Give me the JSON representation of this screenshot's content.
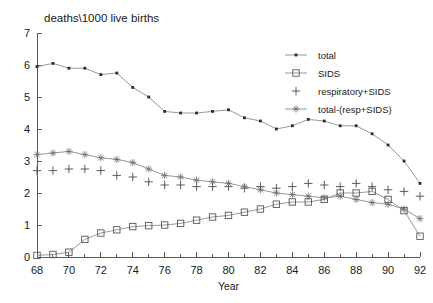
{
  "chart_data": {
    "type": "line",
    "title": "deaths\\1000 live births",
    "xlabel": "Year",
    "ylabel": "",
    "xlim": [
      68,
      92
    ],
    "ylim": [
      0,
      7
    ],
    "xticks": [
      68,
      70,
      72,
      74,
      76,
      78,
      80,
      82,
      84,
      86,
      88,
      90,
      92
    ],
    "yticks": [
      0,
      1,
      2,
      3,
      4,
      5,
      6,
      7
    ],
    "minor_xticks": [
      69,
      71,
      73,
      75,
      77,
      79,
      81,
      83,
      85,
      87,
      89,
      91
    ],
    "grid": false,
    "legend_position": "top-right",
    "x": [
      68,
      69,
      70,
      71,
      72,
      73,
      74,
      75,
      76,
      77,
      78,
      79,
      80,
      81,
      82,
      83,
      84,
      85,
      86,
      87,
      88,
      89,
      90,
      91,
      92
    ],
    "series": [
      {
        "name": "total",
        "marker": "dot",
        "values": [
          5.95,
          6.05,
          5.9,
          5.9,
          5.7,
          5.75,
          5.3,
          5.0,
          4.55,
          4.5,
          4.5,
          4.55,
          4.6,
          4.35,
          4.25,
          4.0,
          4.1,
          4.3,
          4.25,
          4.1,
          4.1,
          3.85,
          3.5,
          3.0,
          2.3
        ]
      },
      {
        "name": "SIDS",
        "marker": "square",
        "values": [
          0.05,
          0.08,
          0.15,
          0.55,
          0.75,
          0.85,
          0.95,
          0.98,
          1.0,
          1.05,
          1.15,
          1.25,
          1.3,
          1.4,
          1.5,
          1.65,
          1.72,
          1.72,
          1.8,
          2.0,
          2.0,
          2.05,
          1.8,
          1.45,
          0.65
        ]
      },
      {
        "name": "respiratory+SIDS",
        "marker": "plus",
        "values": [
          2.7,
          2.7,
          2.75,
          2.75,
          2.7,
          2.55,
          2.5,
          2.35,
          2.25,
          2.25,
          2.2,
          2.2,
          2.2,
          2.15,
          2.2,
          2.15,
          2.2,
          2.3,
          2.25,
          2.2,
          2.3,
          2.2,
          2.1,
          2.05,
          1.9
        ]
      },
      {
        "name": "total-(resp+SIDS)",
        "marker": "star",
        "values": [
          3.2,
          3.25,
          3.3,
          3.2,
          3.1,
          3.05,
          2.95,
          2.75,
          2.55,
          2.5,
          2.4,
          2.35,
          2.3,
          2.2,
          2.1,
          2.0,
          1.95,
          1.9,
          1.85,
          1.9,
          1.8,
          1.7,
          1.65,
          1.5,
          1.2
        ]
      }
    ],
    "legend": [
      {
        "label": "total",
        "marker": "dot"
      },
      {
        "label": "SIDS",
        "marker": "square"
      },
      {
        "label": "respiratory+SIDS",
        "marker": "plus"
      },
      {
        "label": "total-(resp+SIDS)",
        "marker": "star"
      }
    ],
    "colors": {
      "line": "#8c8c8c",
      "marker": "#3a3a3a",
      "axis": "#5a5a5a",
      "text": "#1a1a1a",
      "background": "#ffffff"
    }
  }
}
